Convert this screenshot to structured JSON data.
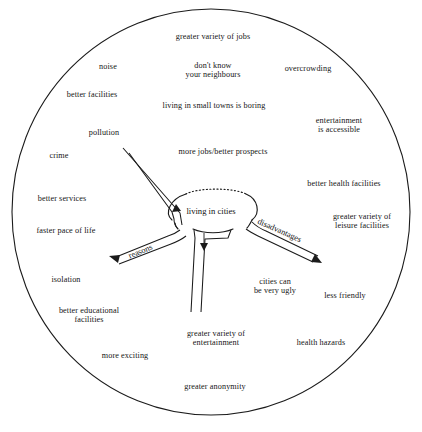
{
  "diagram": {
    "type": "mind-map",
    "title": "living in cities",
    "boundary_shape": "circle",
    "center_node": {
      "label": "living in cities"
    },
    "branches": [
      {
        "id": "reasons",
        "label": "reasons",
        "direction": "down-left"
      },
      {
        "id": "disadvantages",
        "label": "disadvantages",
        "direction": "down-right"
      },
      {
        "id": "up-left",
        "label": "",
        "direction": "up-left"
      },
      {
        "id": "down",
        "label": "",
        "direction": "down"
      }
    ],
    "ideas": [
      {
        "id": "greater-variety-of-jobs",
        "text": "greater variety of jobs",
        "x": 213,
        "y": 37
      },
      {
        "id": "noise",
        "text": "noise",
        "x": 108,
        "y": 67
      },
      {
        "id": "dont-know-your-neighbours",
        "text": "don't know\nyour neighbours",
        "x": 213,
        "y": 70
      },
      {
        "id": "overcrowding",
        "text": "overcrowding",
        "x": 308,
        "y": 69
      },
      {
        "id": "better-facilities",
        "text": "better facilities",
        "x": 92,
        "y": 95
      },
      {
        "id": "living-in-small-towns-is-boring",
        "text": "living in small towns is boring",
        "x": 214,
        "y": 106
      },
      {
        "id": "entertainment-is-accessible",
        "text": "entertainment\nis accessible",
        "x": 339,
        "y": 125
      },
      {
        "id": "pollution",
        "text": "pollution",
        "x": 104,
        "y": 133
      },
      {
        "id": "more-jobs-better-prospects",
        "text": "more jobs/better prospects",
        "x": 223,
        "y": 152
      },
      {
        "id": "crime",
        "text": "crime",
        "x": 59,
        "y": 156
      },
      {
        "id": "better-health-facilities",
        "text": "better health facilities",
        "x": 344,
        "y": 184
      },
      {
        "id": "better-services",
        "text": "better services",
        "x": 62,
        "y": 199
      },
      {
        "id": "greater-variety-of-leisure-facilities",
        "text": "greater variety of\nleisure facilities",
        "x": 362,
        "y": 221
      },
      {
        "id": "faster-pace-of-life",
        "text": "faster pace of life",
        "x": 66,
        "y": 231
      },
      {
        "id": "isolation",
        "text": "isolation",
        "x": 66,
        "y": 280
      },
      {
        "id": "cities-can-be-very-ugly",
        "text": "cities can\nbe very ugly",
        "x": 275,
        "y": 286
      },
      {
        "id": "less-friendly",
        "text": "less friendly",
        "x": 345,
        "y": 296
      },
      {
        "id": "better-educational-facilities",
        "text": "better educational\nfacilities",
        "x": 89,
        "y": 315
      },
      {
        "id": "greater-variety-of-entertainment",
        "text": "greater variety of\nentertainment",
        "x": 216,
        "y": 338
      },
      {
        "id": "health-hazards",
        "text": "health hazards",
        "x": 321,
        "y": 343
      },
      {
        "id": "more-exciting",
        "text": "more exciting",
        "x": 125,
        "y": 356
      },
      {
        "id": "greater-anonymity",
        "text": "greater anonymity",
        "x": 215,
        "y": 387
      }
    ]
  },
  "colors": {
    "ink": "#151515",
    "stroke": "#1b1b1b",
    "background": "#ffffff"
  }
}
